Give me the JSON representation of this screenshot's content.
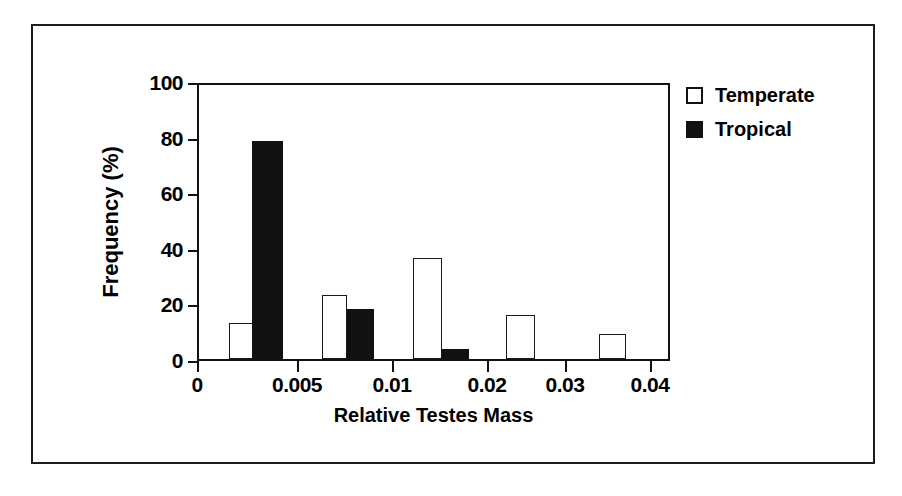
{
  "figure": {
    "background": "#ffffff",
    "frame_color": "#1c1c1c"
  },
  "legend": {
    "position": "top-right-outside",
    "entries": [
      {
        "label": "Temperate",
        "swatch": "open-square-icon",
        "color": "#ffffff"
      },
      {
        "label": "Tropical",
        "swatch": "filled-square-icon",
        "color": "#111111"
      }
    ]
  },
  "chart_data": {
    "type": "bar",
    "title": "",
    "subtitle": "",
    "xlabel": "Relative Testes Mass",
    "ylabel": "Frequency (%)",
    "ylim": [
      0,
      100
    ],
    "yticks": [
      0,
      20,
      40,
      60,
      80,
      100
    ],
    "ytick_labels": [
      "0",
      "20",
      "40",
      "60",
      "80",
      "100"
    ],
    "xtick_labels": [
      "0",
      "0.005",
      "0.01",
      "0.02",
      "0.03",
      "0.04"
    ],
    "xtick_positions_frac": [
      0.0,
      0.2114,
      0.4123,
      0.6131,
      0.778,
      0.9577
    ],
    "grid": false,
    "legend_position": "upper right",
    "categories": [
      "bin-1",
      "bin-2",
      "bin-3",
      "bin-4",
      "bin-5"
    ],
    "series": [
      {
        "name": "Temperate",
        "color": "#ffffff",
        "values": [
          13,
          23,
          36.5,
          16,
          9
        ]
      },
      {
        "name": "Tropical",
        "color": "#111111",
        "values": [
          78.5,
          18,
          3.5,
          0,
          0
        ]
      }
    ],
    "bars": [
      {
        "series": "Temperate",
        "value": 13,
        "left_frac": 0.0634,
        "width_frac": 0.0571
      },
      {
        "series": "Tropical",
        "value": 78.5,
        "left_frac": 0.1121,
        "width_frac": 0.0655
      },
      {
        "series": "Temperate",
        "value": 23,
        "left_frac": 0.2601,
        "width_frac": 0.0529
      },
      {
        "series": "Tropical",
        "value": 18,
        "left_frac": 0.3129,
        "width_frac": 0.0571
      },
      {
        "series": "Temperate",
        "value": 36.5,
        "left_frac": 0.4524,
        "width_frac": 0.0613
      },
      {
        "series": "Tropical",
        "value": 3.5,
        "left_frac": 0.5137,
        "width_frac": 0.0571
      },
      {
        "series": "Temperate",
        "value": 16,
        "left_frac": 0.649,
        "width_frac": 0.0613
      },
      {
        "series": "Temperate",
        "value": 9,
        "left_frac": 0.8457,
        "width_frac": 0.0571
      }
    ]
  }
}
